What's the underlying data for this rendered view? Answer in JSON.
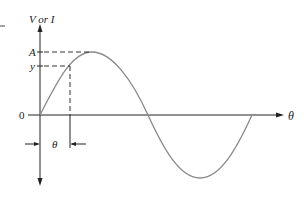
{
  "diagram": {
    "y_axis_label": "V or I",
    "x_axis_label": "θ",
    "origin_label": "0",
    "amplitude_label": "A",
    "value_label": "y",
    "angle_label": "θ",
    "colors": {
      "axis": "#222222",
      "curve": "#8a8a8a",
      "dash": "#333333"
    }
  }
}
